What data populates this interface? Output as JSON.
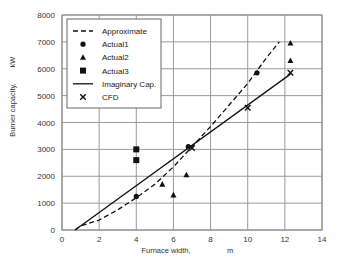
{
  "chart_data": {
    "type": "scatter",
    "title": "",
    "xlabel": "Furnace width,",
    "xunit": "m",
    "ylabel": "Burner capacity,",
    "yunit": "kW",
    "xlim": [
      0,
      14
    ],
    "ylim": [
      0,
      8000
    ],
    "xticks": [
      0,
      2,
      4,
      6,
      8,
      10,
      12,
      14
    ],
    "yticks": [
      0,
      1000,
      2000,
      3000,
      4000,
      5000,
      6000,
      7000,
      8000
    ],
    "grid": true,
    "legend_position": "upper left",
    "series": [
      {
        "name": "Approximate",
        "kind": "line",
        "style": "dashed",
        "x": [
          0.7,
          1.0,
          2.0,
          3.0,
          4.0,
          5.0,
          6.0,
          7.0,
          8.0,
          9.0,
          10.0,
          11.0,
          11.7
        ],
        "y": [
          0,
          150,
          370,
          750,
          1200,
          1700,
          2350,
          3100,
          3850,
          4650,
          5450,
          6400,
          7000
        ]
      },
      {
        "name": "Actual1",
        "kind": "marker",
        "marker": "circle",
        "x": [
          4.0,
          6.8,
          10.5
        ],
        "y": [
          1250,
          3100,
          5850
        ]
      },
      {
        "name": "Actual2",
        "kind": "marker",
        "marker": "triangle",
        "x": [
          5.4,
          6.0,
          6.7,
          12.3,
          12.3
        ],
        "y": [
          1700,
          1300,
          2050,
          6300,
          6950
        ]
      },
      {
        "name": "Actual3",
        "kind": "marker",
        "marker": "square",
        "x": [
          4.0,
          4.0
        ],
        "y": [
          2600,
          3000
        ]
      },
      {
        "name": "Imaginary Cap.",
        "kind": "line",
        "style": "solid",
        "x": [
          0.7,
          12.3
        ],
        "y": [
          0,
          5800
        ]
      },
      {
        "name": "CFD",
        "kind": "marker",
        "marker": "x",
        "x": [
          7.0,
          10.0,
          12.3
        ],
        "y": [
          3050,
          4550,
          5850
        ]
      }
    ]
  },
  "legend": {
    "items": [
      "Approximate",
      "Actual1",
      "Actual2",
      "Actual3",
      "Imaginary Cap.",
      "CFD"
    ]
  }
}
